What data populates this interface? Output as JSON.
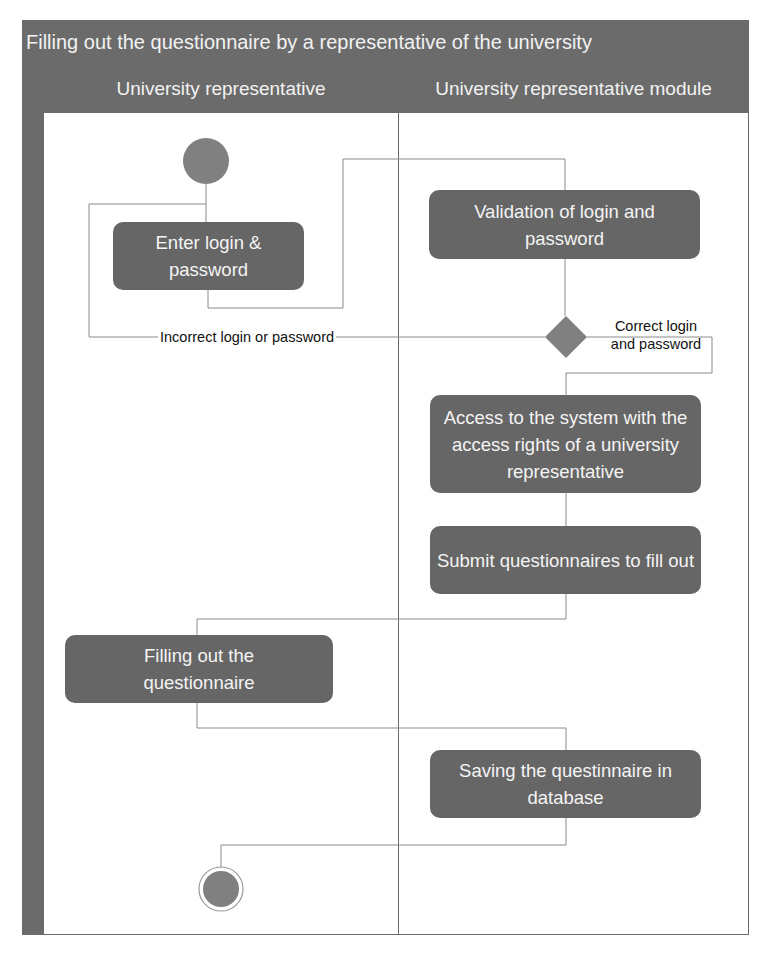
{
  "diagram": {
    "title": "Filling out the questionnaire by a representative of the university",
    "type": "UML activity diagram with swimlanes",
    "colors": {
      "header_fill": "#6b6b6b",
      "activity_fill": "#666666",
      "activity_text": "#f4f4f4",
      "node_fill": "#808080",
      "line": "#888888"
    },
    "lanes": [
      {
        "id": "lane-representative",
        "label": "University representative"
      },
      {
        "id": "lane-module",
        "label": "University representative module"
      }
    ],
    "nodes": {
      "start": {
        "type": "initial",
        "lane": 0
      },
      "enter_login": {
        "type": "activity",
        "lane": 0,
        "label": "Enter login & password"
      },
      "validation": {
        "type": "activity",
        "lane": 1,
        "label": "Validation of login and password"
      },
      "decision": {
        "type": "decision",
        "lane": 1
      },
      "access": {
        "type": "activity",
        "lane": 1,
        "label": "Access to the system with the access rights of a university representative"
      },
      "submit": {
        "type": "activity",
        "lane": 1,
        "label": "Submit questionnaires to fill out"
      },
      "filling": {
        "type": "activity",
        "lane": 0,
        "label": "Filling out the questionnaire"
      },
      "saving": {
        "type": "activity",
        "lane": 1,
        "label": "Saving the questinnaire in database"
      },
      "end": {
        "type": "final",
        "lane": 0
      }
    },
    "guards": {
      "incorrect": "Incorrect login or password",
      "correct_line1": "Correct login",
      "correct_line2": "and password"
    },
    "edges": [
      {
        "from": "start",
        "to": "enter_login"
      },
      {
        "from": "enter_login",
        "to": "validation"
      },
      {
        "from": "validation",
        "to": "decision"
      },
      {
        "from": "decision",
        "to": "enter_login",
        "guard": "Incorrect login or password"
      },
      {
        "from": "decision",
        "to": "access",
        "guard": "Correct login and password"
      },
      {
        "from": "access",
        "to": "submit"
      },
      {
        "from": "submit",
        "to": "filling"
      },
      {
        "from": "filling",
        "to": "saving"
      },
      {
        "from": "saving",
        "to": "end"
      }
    ]
  }
}
